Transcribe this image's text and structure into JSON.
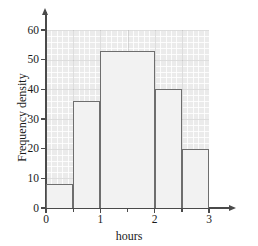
{
  "chart_data": {
    "type": "bar",
    "title": "",
    "subtitle": "",
    "xlabel": "hours",
    "ylabel": "Frequency density",
    "xlim": [
      0,
      3
    ],
    "ylim": [
      0,
      60
    ],
    "grid": true,
    "legend": "none",
    "x_ticks": [
      "0",
      "1",
      "2",
      "3"
    ],
    "x_tick_values": [
      0,
      1,
      2,
      3
    ],
    "x_minor_tick_values": [
      0.5,
      1.5,
      2.5
    ],
    "y_ticks": [
      "0",
      "10",
      "20",
      "30",
      "40",
      "50",
      "60"
    ],
    "y_tick_values": [
      0,
      10,
      20,
      30,
      40,
      50,
      60
    ],
    "categories": [
      "0-0.5",
      "0.5-1",
      "1-2",
      "2-2.5",
      "2.5-3"
    ],
    "bins": [
      {
        "label": "0-0.5",
        "x_start": 0,
        "x_end": 0.5,
        "value": 8
      },
      {
        "label": "0.5-1",
        "x_start": 0.5,
        "x_end": 1,
        "value": 36
      },
      {
        "label": "1-2",
        "x_start": 1,
        "x_end": 2,
        "value": 53
      },
      {
        "label": "2-2.5",
        "x_start": 2,
        "x_end": 2.5,
        "value": 40
      },
      {
        "label": "2.5-3",
        "x_start": 2.5,
        "x_end": 3,
        "value": 20
      }
    ],
    "values": [
      8,
      36,
      53,
      40,
      20
    ],
    "colors": {
      "bar_fill": "#f2f2f2",
      "bar_stroke": "#6e6e6e",
      "grid_background": "#ebebeb",
      "grid_line": "#969696",
      "axis": "#4a4a4a",
      "text": "#1a1a1a",
      "page_background": "#ffffff"
    }
  }
}
